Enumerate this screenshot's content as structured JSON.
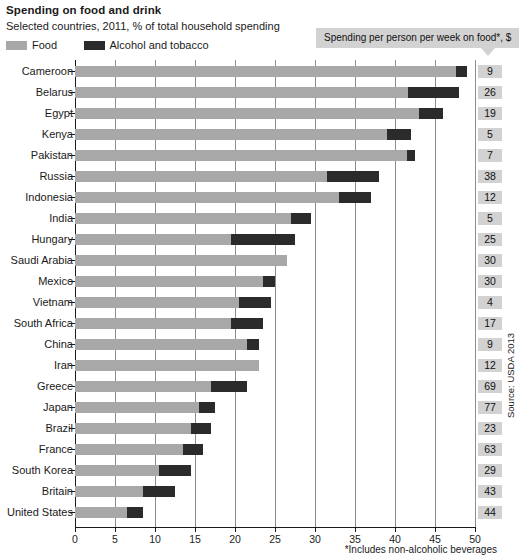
{
  "header": {
    "title": "Spending on food and drink",
    "subtitle": "Selected countries, 2011, % of total household spending"
  },
  "legend": [
    {
      "label": "Food",
      "color": "#a8a8a8",
      "icon": "legend-swatch-food"
    },
    {
      "label": "Alcohol and tobacco",
      "color": "#2b2b2b",
      "icon": "legend-swatch-alcohol"
    }
  ],
  "callout": {
    "text": "Spending per person per week on food*, $"
  },
  "footnote": "*Includes non-alcoholic beverages",
  "source": "Source: USDA 2013",
  "axis": {
    "ticks": [
      "0",
      "5",
      "10",
      "15",
      "20",
      "25",
      "30",
      "35",
      "40",
      "45",
      "50"
    ]
  },
  "chart_data": {
    "type": "bar",
    "orientation": "horizontal",
    "stacked": true,
    "title": "Spending on food and drink",
    "subtitle": "Selected countries, 2011, % of total household spending",
    "xlabel": "% of total household spending",
    "ylabel": "",
    "xlim": [
      0,
      50
    ],
    "xticks": [
      0,
      5,
      10,
      15,
      20,
      25,
      30,
      35,
      40,
      45,
      50
    ],
    "grid": true,
    "legend_position": "top-left",
    "categories": [
      "Cameroon",
      "Belarus",
      "Egypt",
      "Kenya",
      "Pakistan",
      "Russia",
      "Indonesia",
      "India",
      "Hungary",
      "Saudi Arabia",
      "Mexico",
      "Vietnam",
      "South Africa",
      "China",
      "Iran",
      "Greece",
      "Japan",
      "Brazil",
      "France",
      "South Korea",
      "Britain",
      "United States"
    ],
    "series": [
      {
        "name": "Food",
        "color": "#a8a8a8",
        "values": [
          47.6,
          41.6,
          43.0,
          39.0,
          41.5,
          31.5,
          33.0,
          27.0,
          19.5,
          26.5,
          23.5,
          20.5,
          19.5,
          21.5,
          23.0,
          17.0,
          15.5,
          14.5,
          13.5,
          10.5,
          8.5,
          6.5
        ]
      },
      {
        "name": "Alcohol and tobacco",
        "color": "#2b2b2b",
        "values": [
          1.4,
          6.4,
          3.0,
          3.0,
          1.0,
          6.5,
          4.0,
          2.5,
          8.0,
          0.0,
          1.5,
          4.0,
          4.0,
          1.5,
          0.0,
          4.5,
          2.0,
          2.5,
          2.5,
          4.0,
          4.0,
          2.0
        ]
      }
    ],
    "annotation_series": {
      "name": "Spending per person per week on food*, $",
      "values": [
        9,
        26,
        19,
        5,
        7,
        38,
        12,
        5,
        25,
        30,
        30,
        4,
        17,
        9,
        12,
        69,
        77,
        23,
        63,
        29,
        43,
        44
      ]
    }
  }
}
